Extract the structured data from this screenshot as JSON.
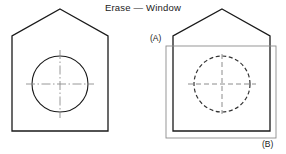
{
  "figure": {
    "title": "Erase — Window",
    "labels": {
      "corner_a": "(A)",
      "corner_b": "(B)"
    },
    "colors": {
      "background": "#ffffff",
      "object_line": "#1a1a1a",
      "centerline": "#8c8c8c",
      "selection_window": "#8c8c8c",
      "selected_object": "#333333",
      "text": "#1a1a1a"
    },
    "panels": [
      {
        "id": "before",
        "name": "original-drawing",
        "house": {
          "apex": [
            60,
            9
          ],
          "left_shoulder": [
            12,
            36
          ],
          "right_shoulder": [
            108,
            36
          ],
          "bottom_left": [
            12,
            131
          ],
          "bottom_right": [
            108,
            131
          ]
        },
        "circle": {
          "center": [
            60,
            84
          ],
          "radius": 28,
          "style": "solid"
        },
        "centerlines": {
          "style": "dash-dot",
          "horizontal_extent": [
            26,
            94
          ],
          "vertical_extent": [
            50,
            118
          ]
        }
      },
      {
        "id": "after",
        "name": "window-selection",
        "house": {
          "apex": [
            222,
            9
          ],
          "left_shoulder": [
            173,
            36
          ],
          "right_shoulder": [
            270,
            36
          ],
          "bottom_left": [
            173,
            131
          ],
          "bottom_right": [
            270,
            131
          ]
        },
        "circle": {
          "center": [
            222,
            84
          ],
          "radius": 28,
          "style": "dashed"
        },
        "centerlines": {
          "style": "dashed",
          "horizontal_extent": [
            188,
            256
          ],
          "vertical_extent": [
            54,
            114
          ]
        },
        "selection_window": {
          "corner_a": [
            166,
            46
          ],
          "corner_b": [
            276,
            138
          ],
          "style": "thin-solid-gray"
        }
      }
    ]
  }
}
